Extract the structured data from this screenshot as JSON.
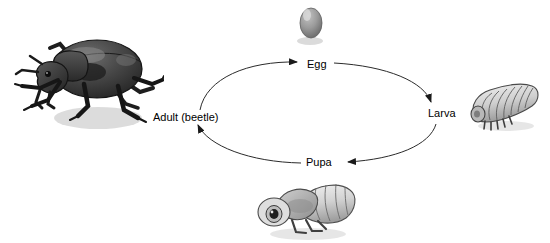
{
  "diagram": {
    "type": "life-cycle",
    "background_color": "#ffffff",
    "label_color": "#000000",
    "arrow_color": "#1a1a1a",
    "stages": [
      {
        "id": "adult",
        "label": "Adult (beetle)",
        "position": "left",
        "illustration": "beetle-illustration"
      },
      {
        "id": "egg",
        "label": "Egg",
        "position": "top",
        "illustration": "egg-illustration"
      },
      {
        "id": "larva",
        "label": "Larva",
        "position": "right",
        "illustration": "larva-illustration"
      },
      {
        "id": "pupa",
        "label": "Pupa",
        "position": "bottom",
        "illustration": "pupa-illustration"
      }
    ],
    "arrows": [
      {
        "from": "adult",
        "to": "egg",
        "direction": "clockwise"
      },
      {
        "from": "egg",
        "to": "larva",
        "direction": "clockwise"
      },
      {
        "from": "larva",
        "to": "pupa",
        "direction": "clockwise"
      },
      {
        "from": "pupa",
        "to": "adult",
        "direction": "clockwise"
      }
    ]
  }
}
